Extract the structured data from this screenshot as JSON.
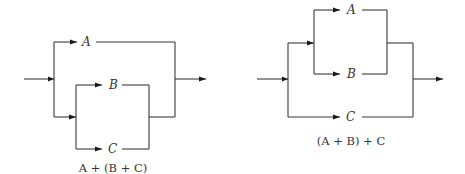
{
  "diagrams": [
    {
      "id": "left",
      "caption": "A + (B + C)",
      "labels": {
        "a": "A",
        "b": "B",
        "c": "C"
      },
      "structure": "A in parallel with (B in parallel with C)"
    },
    {
      "id": "right",
      "caption": "(A + B) + C",
      "labels": {
        "a": "A",
        "b": "B",
        "c": "C"
      },
      "structure": "(A in parallel with B) in parallel with C"
    }
  ],
  "colors": {
    "line": "#3a3a3a",
    "arrow": "#1a1a1a",
    "text": "#333333",
    "background": "#ffffff"
  }
}
